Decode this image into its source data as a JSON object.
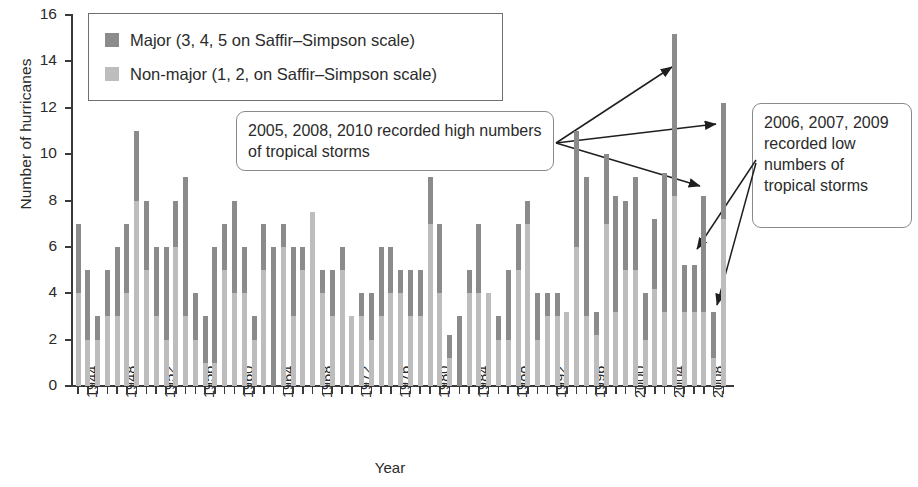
{
  "chart_data": {
    "type": "bar",
    "stacked": true,
    "title": "",
    "xlabel": "Year",
    "ylabel": "Number of hurricanes",
    "ylim": [
      0,
      16
    ],
    "ytick_values": [
      0,
      2,
      4,
      6,
      8,
      10,
      12,
      14,
      16
    ],
    "ytick_labels": [
      "0",
      "2",
      "4",
      "6",
      "8",
      "10",
      "12",
      "14",
      "16"
    ],
    "xtick_labels": [
      "1944",
      "1948",
      "1952",
      "1956",
      "1960",
      "1964",
      "1968",
      "1972",
      "1976",
      "1980",
      "1984",
      "1988",
      "1992",
      "1996",
      "2000",
      "2004",
      "2008"
    ],
    "xlim": [
      1944,
      2010
    ],
    "grid": false,
    "legend_position": "top-left",
    "series": [
      {
        "name": "Non-major (1, 2, on Saffir-Simpson scale)",
        "color": "#bdbdbd"
      },
      {
        "name": "Major (3, 4, 5 on Saffir-Simpson scale)",
        "color": "#8b8b8b"
      }
    ],
    "categories": [
      1944,
      1945,
      1946,
      1947,
      1948,
      1949,
      1950,
      1951,
      1952,
      1953,
      1954,
      1955,
      1956,
      1957,
      1958,
      1959,
      1960,
      1961,
      1962,
      1963,
      1964,
      1965,
      1966,
      1967,
      1968,
      1969,
      1970,
      1971,
      1972,
      1973,
      1974,
      1975,
      1976,
      1977,
      1978,
      1979,
      1980,
      1981,
      1982,
      1983,
      1984,
      1985,
      1986,
      1987,
      1988,
      1989,
      1990,
      1991,
      1992,
      1993,
      1994,
      1995,
      1996,
      1997,
      1998,
      1999,
      2000,
      2001,
      2002,
      2003,
      2004,
      2005,
      2006,
      2007,
      2008,
      2009,
      2010
    ],
    "totals": [
      7,
      5,
      3,
      5,
      6,
      7,
      11,
      8,
      6,
      6,
      8,
      9,
      4,
      3,
      6,
      7,
      8,
      6,
      3,
      7,
      6,
      7,
      6,
      6,
      7.5,
      5,
      5,
      6,
      3,
      4,
      4,
      6,
      6,
      5,
      5,
      5,
      9,
      7,
      2.2,
      3,
      5,
      7,
      4,
      3,
      5,
      7,
      8,
      4,
      4,
      4,
      3.2,
      11,
      9,
      3.2,
      10,
      8.2,
      8,
      9,
      4,
      7.2,
      9.2,
      15.2,
      5.2,
      5.2,
      8.2,
      3.2,
      12.2
    ],
    "major": [
      3,
      3,
      1,
      2,
      3,
      3,
      3,
      3,
      3,
      4,
      2,
      6,
      2,
      2,
      5,
      2,
      4,
      2,
      1,
      2,
      6,
      1,
      3,
      1,
      0,
      1,
      2,
      1,
      0,
      1,
      2,
      3,
      2,
      1,
      2,
      2,
      2,
      3,
      1,
      3,
      1,
      3,
      0,
      1,
      3,
      2,
      1,
      2,
      1,
      1,
      0,
      5,
      6,
      1,
      3,
      5,
      3,
      4,
      2,
      3,
      6,
      7,
      2,
      2,
      5,
      2,
      5
    ]
  },
  "legend": {
    "items": [
      {
        "swatch": "major",
        "label": "Major (3, 4, 5 on Saffir–Simpson scale)"
      },
      {
        "swatch": "minor",
        "label": "Non-major (1, 2, on Saffir–Simpson scale)"
      }
    ]
  },
  "annotations": {
    "high": "2005, 2008, 2010 recorded high numbers of tropical storms",
    "low": "2006, 2007, 2009 recorded low numbers of tropical storms"
  },
  "axes": {
    "ylabel": "Number of hurricanes",
    "xlabel": "Year"
  }
}
